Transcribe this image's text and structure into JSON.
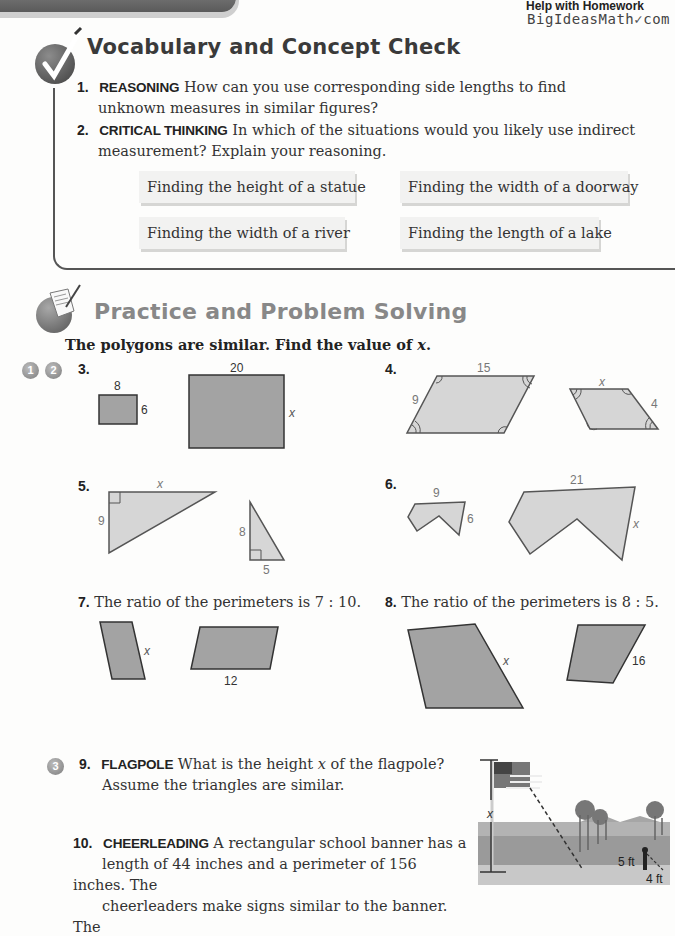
{
  "header": {
    "help_line1": "Help with Homework",
    "help_line2": "BigIdeasMath",
    "help_line2_suffix": "com"
  },
  "vocab": {
    "title": "Vocabulary and Concept Check",
    "icon": "checkmark-icon",
    "questions": [
      {
        "number": "1.",
        "keyword": "REASONING",
        "text_line1": "How can you use corresponding side lengths to find",
        "text_line2": "unknown measures in similar figures?"
      },
      {
        "number": "2.",
        "keyword": "CRITICAL THINKING",
        "text_line1": "In which of the situations would you likely use indirect",
        "text_line2": "measurement? Explain your reasoning."
      }
    ],
    "choices": [
      "Finding the height of a statue",
      "Finding the width of a doorway",
      "Finding the width of a river",
      "Finding the length of a lake"
    ]
  },
  "practice": {
    "title": "Practice and Problem Solving",
    "icon": "notepad-pencil-icon",
    "instruction": "The polygons are similar. Find the value of",
    "instruction_var": "x",
    "instruction_end": ".",
    "badges_group1": [
      "1",
      "2"
    ],
    "badges_group2": [
      "3"
    ],
    "problems": {
      "p3": {
        "number": "3.",
        "small_top": "8",
        "small_side": "6",
        "large_top": "20",
        "large_side": "x"
      },
      "p4": {
        "number": "4.",
        "large_top": "15",
        "large_side": "9",
        "small_top": "x",
        "small_side": "4"
      },
      "p5": {
        "number": "5.",
        "large_top": "x",
        "large_side": "9",
        "small_side": "8",
        "small_bottom": "5"
      },
      "p6": {
        "number": "6.",
        "small_top": "9",
        "small_side": "6",
        "large_top": "21",
        "large_side": "x"
      },
      "p7": {
        "number": "7.",
        "text": "The ratio of the perimeters is 7 : 10.",
        "left_side": "x",
        "right_bottom": "12"
      },
      "p8": {
        "number": "8.",
        "text": "The ratio of the perimeters is 8 : 5.",
        "left_side": "x",
        "right_side": "16"
      },
      "p9": {
        "number": "9.",
        "keyword": "FLAGPOLE",
        "text_pre": "What is the height",
        "text_var": "x",
        "text_post": "of the flagpole?",
        "text_line2": "Assume the triangles are similar.",
        "fig_height": "x",
        "fig_person": "5 ft",
        "fig_shadow": "4 ft"
      },
      "p10": {
        "number": "10.",
        "keyword": "CHEERLEADING",
        "text_line1": "A rectangular school banner has a",
        "text_line2": "length of 44 inches and a perimeter of 156 inches. The",
        "text_line3": "cheerleaders make signs similar to the banner. The"
      }
    }
  }
}
